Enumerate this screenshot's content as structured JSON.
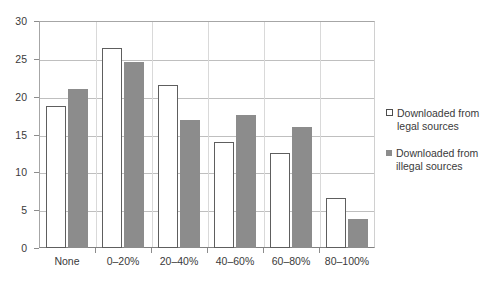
{
  "chart_data": {
    "type": "bar",
    "title": "",
    "subtitle": "",
    "xlabel": "",
    "ylabel": "",
    "categories": [
      "None",
      "0–20%",
      "20–40%",
      "40–60%",
      "60–80%",
      "80–100%"
    ],
    "series": [
      {
        "name": "Downloaded from legal sources",
        "color": "#ffffff",
        "border_color": "#5e5e5e",
        "values": [
          18.8,
          26.4,
          21.5,
          14.0,
          12.6,
          6.6
        ]
      },
      {
        "name": "Downloaded from illegal sources",
        "color": "#8c8c8c",
        "border_color": "#8c8c8c",
        "values": [
          21.0,
          24.6,
          16.9,
          17.6,
          16.0,
          3.9
        ]
      }
    ],
    "ylim": [
      0,
      30
    ],
    "yticks": [
      0,
      5,
      10,
      15,
      20,
      25,
      30
    ],
    "ytick_labels": [
      "0",
      "5",
      "10",
      "15",
      "20",
      "25",
      "30"
    ],
    "grid": true,
    "grid_axis": "y",
    "legend_position": "right",
    "annotations": []
  },
  "legend": {
    "entries": [
      {
        "label_line1": "Downloaded from",
        "label_line2": "legal sources"
      },
      {
        "label_line1": "Downloaded from",
        "label_line2": "illegal sources"
      }
    ]
  }
}
